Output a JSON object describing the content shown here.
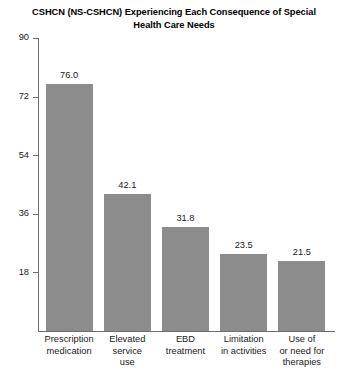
{
  "chart_data": {
    "type": "bar",
    "title": "CSHCN (NS-CSHCN) Experiencing Each Consequence of Special Health Care Needs",
    "title_line1": "CSHCN (NS-CSHCN) Experiencing Each Consequence of Special",
    "title_line2": "Health Care Needs",
    "xlabel": "",
    "ylabel": "",
    "ylim": [
      0,
      90
    ],
    "yticks": [
      90,
      72,
      54,
      36,
      18
    ],
    "grid": false,
    "legend": false,
    "bar_color": "#8c8c8c",
    "axis_color": "#6e6e6e",
    "categories": [
      "Prescription medication",
      "Elevated service use",
      "EBD treatment",
      "Limitation in activities",
      "Use of or need for therapies"
    ],
    "category_lines": [
      [
        "Prescription",
        "medication"
      ],
      [
        "Elevated",
        "service",
        "use"
      ],
      [
        "EBD",
        "treatment"
      ],
      [
        "Limitation",
        "in activities"
      ],
      [
        "Use of",
        "or need for",
        "therapies"
      ]
    ],
    "values": [
      76.0,
      42.1,
      31.8,
      23.5,
      21.5
    ],
    "value_labels": [
      "76.0",
      "42.1",
      "31.8",
      "23.5",
      "21.5"
    ]
  }
}
